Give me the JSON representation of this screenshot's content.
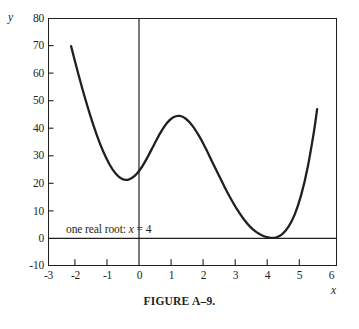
{
  "figure": {
    "caption": "FIGURE A–9."
  },
  "axes": {
    "y_axis_name": "y",
    "x_axis_name": "x",
    "y_ticks": [
      "80",
      "70",
      "60",
      "50",
      "40",
      "30",
      "20",
      "10",
      "0",
      "-10"
    ],
    "x_ticks": [
      "-3",
      "-2",
      "-1",
      "0",
      "1",
      "2",
      "3",
      "4",
      "5",
      "6"
    ]
  },
  "annotation": {
    "text_prefix": "one real root:",
    "variable": "x",
    "text_suffix": "= 4"
  },
  "colors": {
    "curve": "#231f20",
    "frame": "#231f20",
    "axis_line": "#231f20",
    "background": "#ffffff",
    "text": "#231f20"
  },
  "chart_data": {
    "type": "line",
    "xlabel": "x",
    "ylabel": "y",
    "xlim": [
      -3,
      6
    ],
    "ylim": [
      -10,
      80
    ],
    "xticks": [
      -3,
      -2,
      -1,
      0,
      1,
      2,
      3,
      4,
      5,
      6
    ],
    "yticks": [
      -10,
      0,
      10,
      20,
      30,
      40,
      50,
      60,
      70,
      80
    ],
    "grid": false,
    "legend": null,
    "axis_lines": {
      "x_axis_at_y": 0,
      "y_axis_at_x": 0
    },
    "annotations": [
      {
        "text": "one real root: x = 4",
        "x": -2.3,
        "y": 2.5,
        "note": "curve is tangent to y = 0 at x = 4 (double root)"
      }
    ],
    "series": [
      {
        "name": "f(x)",
        "description": "quartic polynomial with a double root at x = 4; local minimum near (-0.7, 21.5), local maximum near (1.2, 44.5), minimum touching zero at (4, 0)",
        "x": [
          -2.3,
          -2.1,
          -1.9,
          -1.7,
          -1.5,
          -1.3,
          -1.1,
          -0.9,
          -0.7,
          -0.5,
          -0.3,
          -0.1,
          0.1,
          0.3,
          0.5,
          0.7,
          0.9,
          1.1,
          1.3,
          1.5,
          1.7,
          1.9,
          2.1,
          2.3,
          2.5,
          2.7,
          2.9,
          3.1,
          3.3,
          3.5,
          3.7,
          3.9,
          4.0,
          4.1,
          4.3,
          4.5,
          4.7,
          4.9,
          5.1,
          5.3,
          5.4
        ],
        "y": [
          70.0,
          61.0,
          52.5,
          44.7,
          37.7,
          31.7,
          26.9,
          23.4,
          21.5,
          21.3,
          22.7,
          25.6,
          29.6,
          34.1,
          38.4,
          41.9,
          44.0,
          44.5,
          43.4,
          40.9,
          37.3,
          33.0,
          28.2,
          23.4,
          18.7,
          14.3,
          10.3,
          6.9,
          4.1,
          2.1,
          0.8,
          0.1,
          0.0,
          0.1,
          1.3,
          4.0,
          8.6,
          15.6,
          25.5,
          38.8,
          47.0
        ]
      }
    ]
  },
  "curve_path": "M 66.2,45.6 C 75.0,69.9 86.5,105.3 96.0,133.8 C 104.5,159.3 112.0,174.5 118.5,176.0 C 125.5,177.6 131.5,165.0 139.0,147.0 C 147.5,126.6 156.0,114.0 166.0,113.0 C 175.5,112.0 181.0,116.6 186.0,128.0 C 193.0,144.0 199.5,164.0 208.0,185.0 C 217.0,207.0 226.0,222.5 235.0,231.5 C 243.0,239.5 251.0,239.2 257.5,237.5 C 266.0,235.2 274.5,224.0 283.0,205.0 C 293.0,182.5 303.0,130.0 311.8,84.0"
}
